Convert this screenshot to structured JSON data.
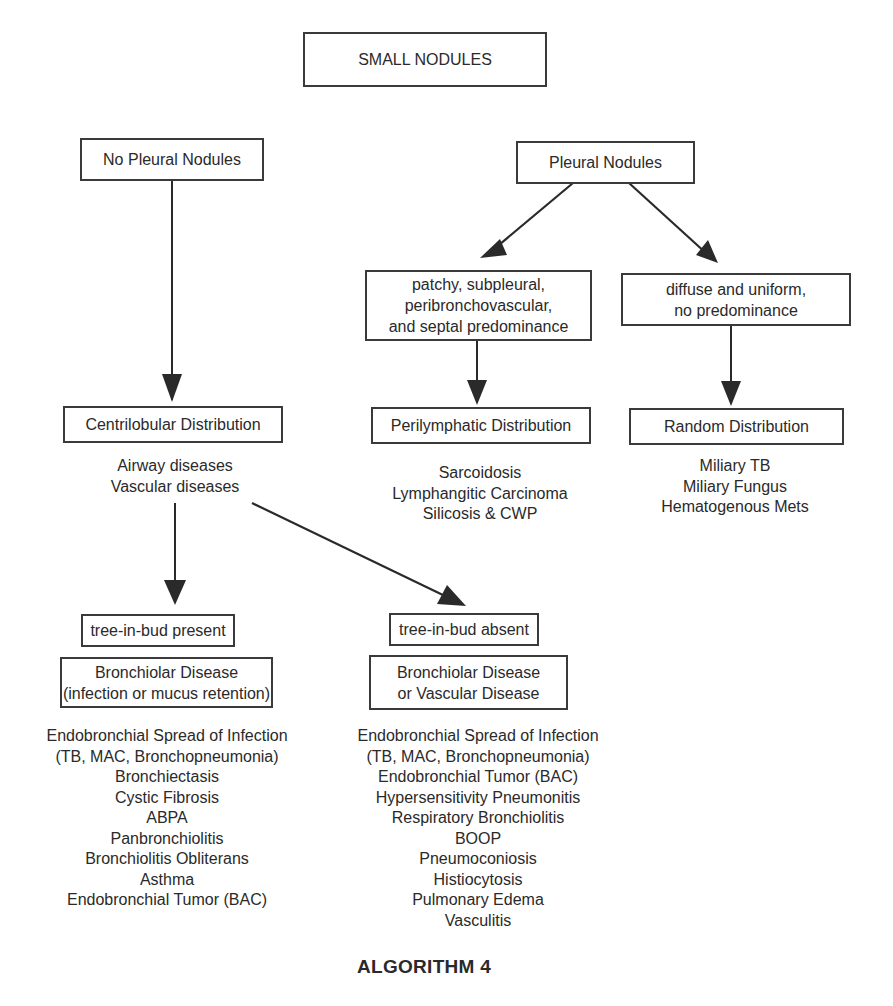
{
  "root": {
    "label": "SMALL NODULES"
  },
  "left_branch": {
    "label": "No Pleural Nodules",
    "distribution": "Centrilobular Distribution",
    "diseases": [
      "Airway diseases",
      "Vascular diseases"
    ],
    "present": {
      "label": "tree-in-bud present",
      "category_lines": [
        "Bronchiolar Disease",
        "(infection or mucus retention)"
      ],
      "items": [
        "Endobronchial Spread of Infection",
        "(TB, MAC, Bronchopneumonia)",
        "Bronchiectasis",
        "Cystic Fibrosis",
        "ABPA",
        "Panbronchiolitis",
        "Bronchiolitis Obliterans",
        "Asthma",
        "Endobronchial Tumor (BAC)"
      ]
    },
    "absent": {
      "label": "tree-in-bud absent",
      "category_lines": [
        "Bronchiolar Disease",
        "or Vascular Disease"
      ],
      "items": [
        "Endobronchial Spread of Infection",
        "(TB, MAC, Bronchopneumonia)",
        "Endobronchial Tumor (BAC)",
        "Hypersensitivity Pneumonitis",
        "Respiratory Bronchiolitis",
        "BOOP",
        "Pneumoconiosis",
        "Histiocytosis",
        "Pulmonary Edema",
        "Vasculitis"
      ]
    }
  },
  "right_branch": {
    "label": "Pleural Nodules",
    "patchy": {
      "lines": [
        "patchy, subpleural,",
        "peribronchovascular,",
        "and septal predominance"
      ],
      "distribution": "Perilymphatic Distribution",
      "items": [
        "Sarcoidosis",
        "Lymphangitic Carcinoma",
        "Silicosis & CWP"
      ]
    },
    "diffuse": {
      "lines": [
        "diffuse and uniform,",
        "no predominance"
      ],
      "distribution": "Random Distribution",
      "items": [
        "Miliary TB",
        "Miliary Fungus",
        "Hematogenous Mets"
      ]
    }
  },
  "caption": "ALGORITHM 4",
  "colors": {
    "line": "#3a3a3a",
    "text": "#2a2a2a",
    "background": "#ffffff"
  }
}
